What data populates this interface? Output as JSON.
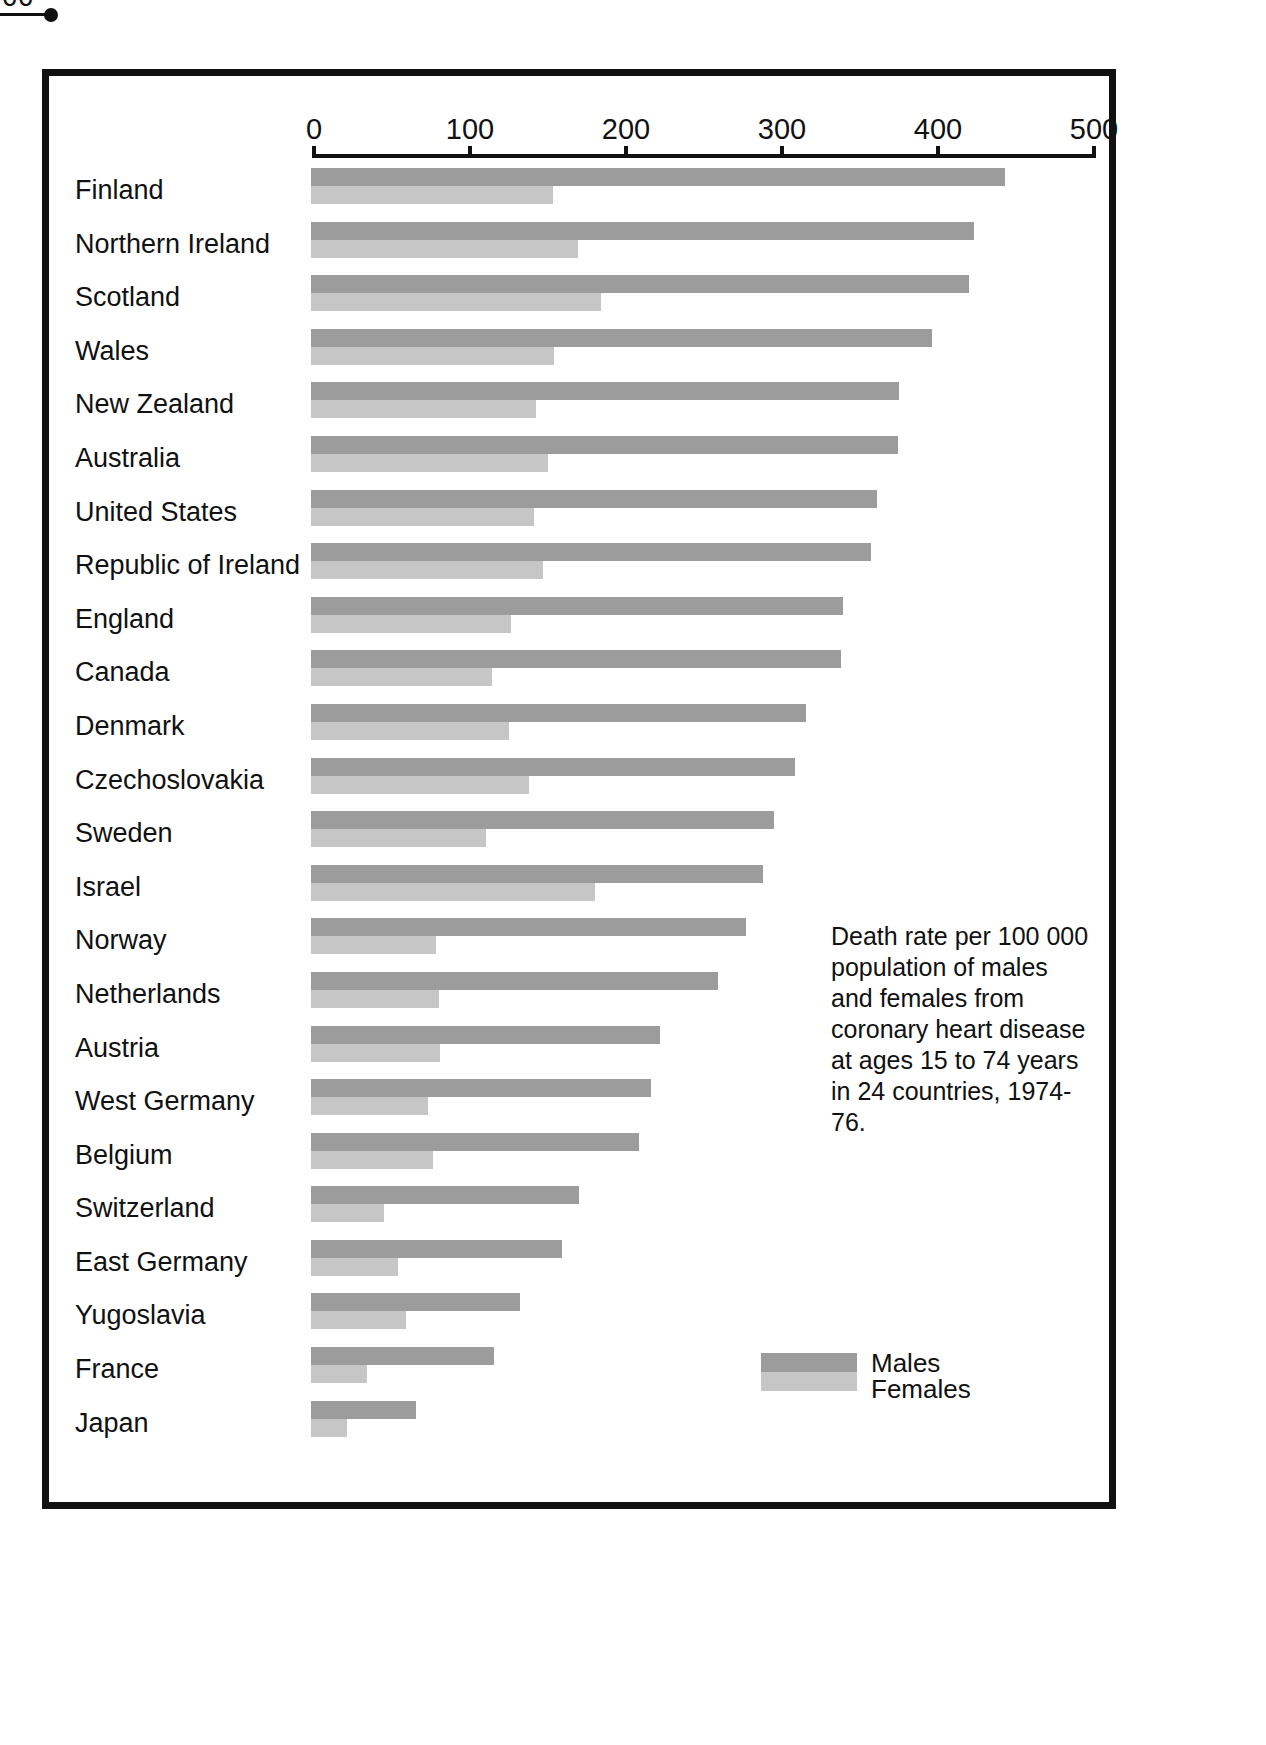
{
  "page": {
    "folio": "66"
  },
  "caption": {
    "text": "Death rate per 100 000 population of males and females from coronary heart disease at ages 15 to 74 years in 24 countries, 1974-76."
  },
  "legend": {
    "males_label": "Males",
    "females_label": "Females",
    "males_color": "#9c9c9c",
    "females_color": "#c6c6c6"
  },
  "axis": {
    "ticks": [
      0,
      100,
      200,
      300,
      400,
      500
    ],
    "tick_labels": [
      "0",
      "100",
      "200",
      "300",
      "400",
      "500"
    ],
    "min": 0,
    "max": 500
  },
  "chart_data": {
    "type": "bar",
    "orientation": "horizontal",
    "title": "",
    "subtitle": "",
    "xlabel": "Death rate per 100 000 population",
    "ylabel": "",
    "xlim": [
      0,
      500
    ],
    "grid": false,
    "legend_position": "bottom-right",
    "categories": [
      "Finland",
      "Northern Ireland",
      "Scotland",
      "Wales",
      "New Zealand",
      "Australia",
      "United States",
      "Republic of Ireland",
      "England",
      "Canada",
      "Denmark",
      "Czechoslovakia",
      "Sweden",
      "Israel",
      "Norway",
      "Netherlands",
      "Austria",
      "West Germany",
      "Belgium",
      "Switzerland",
      "East Germany",
      "Yugoslavia",
      "France",
      "Japan"
    ],
    "series": [
      {
        "name": "Males",
        "color": "#9c9c9c",
        "values": [
          445,
          425,
          422,
          398,
          377,
          376,
          363,
          359,
          341,
          340,
          317,
          310,
          297,
          290,
          279,
          261,
          224,
          218,
          210,
          172,
          161,
          134,
          117,
          67
        ]
      },
      {
        "name": "Females",
        "color": "#c6c6c6",
        "values": [
          155,
          171,
          186,
          156,
          144,
          152,
          143,
          149,
          128,
          116,
          127,
          140,
          112,
          182,
          80,
          82,
          83,
          75,
          78,
          47,
          56,
          61,
          36,
          23
        ]
      }
    ],
    "annotations": [
      "Death rate per 100 000 population of males and females from coronary heart disease at ages 15 to 74 years in 24 countries, 1974-76."
    ]
  }
}
